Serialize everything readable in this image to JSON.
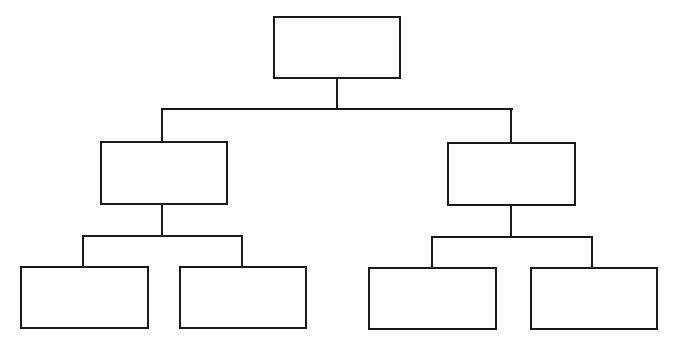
{
  "diagram": {
    "type": "org-chart-tree",
    "stroke_color": "#1a1a1a",
    "background": "#ffffff",
    "nodes": [
      {
        "id": "root",
        "label": "",
        "x": 273,
        "y": 16,
        "w": 128,
        "h": 63
      },
      {
        "id": "mid-left",
        "label": "",
        "x": 100,
        "y": 141,
        "w": 128,
        "h": 64
      },
      {
        "id": "mid-right",
        "label": "",
        "x": 447,
        "y": 142,
        "w": 129,
        "h": 64
      },
      {
        "id": "leaf-1",
        "label": "",
        "x": 20,
        "y": 266,
        "w": 129,
        "h": 63
      },
      {
        "id": "leaf-2",
        "label": "",
        "x": 179,
        "y": 266,
        "w": 128,
        "h": 63
      },
      {
        "id": "leaf-3",
        "label": "",
        "x": 368,
        "y": 267,
        "w": 129,
        "h": 63
      },
      {
        "id": "leaf-4",
        "label": "",
        "x": 530,
        "y": 267,
        "w": 128,
        "h": 63
      }
    ],
    "edges": [
      {
        "from": "root",
        "to": "mid-left"
      },
      {
        "from": "root",
        "to": "mid-right"
      },
      {
        "from": "mid-left",
        "to": "leaf-1"
      },
      {
        "from": "mid-left",
        "to": "leaf-2"
      },
      {
        "from": "mid-right",
        "to": "leaf-3"
      },
      {
        "from": "mid-right",
        "to": "leaf-4"
      }
    ]
  }
}
